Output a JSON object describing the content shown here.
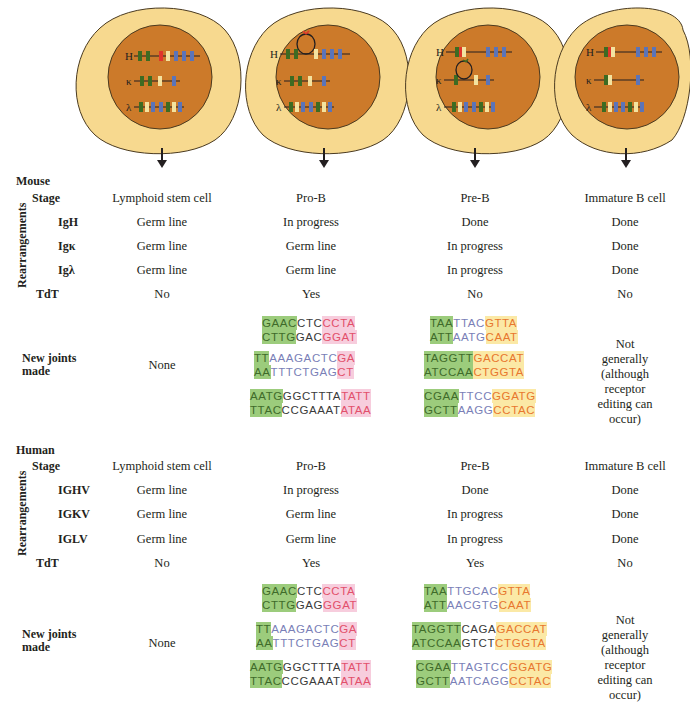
{
  "figure": {
    "cells": [
      {
        "stage": "Lymphoid stem cell",
        "loci": [
          "H",
          "κ",
          "λ"
        ],
        "loop": "none"
      },
      {
        "stage": "Pro-B",
        "loci": [
          "H",
          "κ",
          "λ"
        ],
        "loop": "H"
      },
      {
        "stage": "Pre-B",
        "loci": [
          "H",
          "κ",
          "λ"
        ],
        "loop": "κ"
      },
      {
        "stage": "Immature B cell",
        "loci": [
          "H",
          "κ",
          "λ"
        ],
        "loop": "none"
      }
    ],
    "colors": {
      "cytoplasm": "#f7d98f",
      "nucleus": "#cc7a2a",
      "segment_green": "#3d6b22",
      "segment_blue": "#5b74b8",
      "segment_yellow": "#f3e3a0",
      "segment_red": "#e0352b",
      "seq_green_bg": "#9ccc7c",
      "seq_pink_bg": "#f7cddd",
      "seq_yellow_bg": "#fbe9a6"
    }
  },
  "mouse": {
    "title": "Mouse",
    "stage_label": "Stage",
    "rearrangements_label": "Rearrangements",
    "tdt_label": "TdT",
    "joints_label_1": "New joints",
    "joints_label_2": "made",
    "genes": [
      "IgH",
      "Igκ",
      "Igλ"
    ],
    "stages": [
      "Lymphoid stem cell",
      "Pro-B",
      "Pre-B",
      "Immature B cell"
    ],
    "rows": [
      [
        "Germ line",
        "In progress",
        "Done",
        "Done"
      ],
      [
        "Germ line",
        "Germ line",
        "In progress",
        "Done"
      ],
      [
        "Germ line",
        "Germ line",
        "In progress",
        "Done"
      ]
    ],
    "tdt": [
      "No",
      "Yes",
      "No",
      "No"
    ],
    "joints_none": "None",
    "joints_immature": [
      "Not generally",
      "(although",
      "receptor",
      "editing can",
      "occur)"
    ],
    "pro_b_seqs": [
      {
        "top": [
          [
            "g",
            "GAAC"
          ],
          [
            "k",
            "CTC"
          ],
          [
            "p",
            "CCTA"
          ]
        ],
        "bot": [
          [
            "g",
            "CTTG"
          ],
          [
            "k",
            "GAC"
          ],
          [
            "p",
            "GGAT"
          ]
        ]
      },
      {
        "top": [
          [
            "g",
            "TT"
          ],
          [
            "b",
            "AAAGACTC"
          ],
          [
            "p",
            "GA"
          ]
        ],
        "bot": [
          [
            "g",
            "AA"
          ],
          [
            "b",
            "TTTCTGAG"
          ],
          [
            "p",
            "CT"
          ]
        ]
      },
      {
        "top": [
          [
            "g",
            "AATG"
          ],
          [
            "k",
            "GGCTTTA"
          ],
          [
            "p",
            "TATT"
          ]
        ],
        "bot": [
          [
            "g",
            "TTAC"
          ],
          [
            "k",
            "CCGAAAT"
          ],
          [
            "p",
            "ATAA"
          ]
        ]
      }
    ],
    "pre_b_seqs": [
      {
        "top": [
          [
            "g",
            "TAA"
          ],
          [
            "b",
            "TTAC"
          ],
          [
            "y",
            "GTTA"
          ]
        ],
        "bot": [
          [
            "g",
            "ATT"
          ],
          [
            "b",
            "AATG"
          ],
          [
            "y",
            "CAAT"
          ]
        ]
      },
      {
        "top": [
          [
            "g",
            "TAGGTT"
          ],
          [
            "y",
            "GACCAT"
          ]
        ],
        "bot": [
          [
            "g",
            "ATCCAA"
          ],
          [
            "y",
            "CTGGTA"
          ]
        ]
      },
      {
        "top": [
          [
            "g",
            "CGAA"
          ],
          [
            "b",
            "TTCC"
          ],
          [
            "y",
            "GGATG"
          ]
        ],
        "bot": [
          [
            "g",
            "GCTT"
          ],
          [
            "b",
            "AAGG"
          ],
          [
            "y",
            "CCTAC"
          ]
        ]
      }
    ]
  },
  "human": {
    "title": "Human",
    "stage_label": "Stage",
    "rearrangements_label": "Rearrangements",
    "tdt_label": "TdT",
    "joints_label_1": "New joints",
    "joints_label_2": "made",
    "genes": [
      "IGHV",
      "IGKV",
      "IGLV"
    ],
    "stages": [
      "Lymphoid stem cell",
      "Pro-B",
      "Pre-B",
      "Immature B cell"
    ],
    "rows": [
      [
        "Germ line",
        "In progress",
        "Done",
        "Done"
      ],
      [
        "Germ line",
        "Germ line",
        "In progress",
        "Done"
      ],
      [
        "Germ line",
        "Germ line",
        "In progress",
        "Done"
      ]
    ],
    "tdt": [
      "No",
      "Yes",
      "Yes",
      "No"
    ],
    "joints_none": "None",
    "joints_immature": [
      "Not generally",
      "(although",
      "receptor",
      "editing can",
      "occur)"
    ],
    "pro_b_seqs": [
      {
        "top": [
          [
            "g",
            "GAAC"
          ],
          [
            "k",
            "CTC"
          ],
          [
            "p",
            "CCTA"
          ]
        ],
        "bot": [
          [
            "g",
            "CTTG"
          ],
          [
            "k",
            "GAG"
          ],
          [
            "p",
            "GGAT"
          ]
        ]
      },
      {
        "top": [
          [
            "g",
            "TT"
          ],
          [
            "b",
            "AAAGACTC"
          ],
          [
            "p",
            "GA"
          ]
        ],
        "bot": [
          [
            "g",
            "AA"
          ],
          [
            "b",
            "TTTCTGAG"
          ],
          [
            "p",
            "CT"
          ]
        ]
      },
      {
        "top": [
          [
            "g",
            "AATG"
          ],
          [
            "k",
            "GGCTTTA"
          ],
          [
            "p",
            "TATT"
          ]
        ],
        "bot": [
          [
            "g",
            "TTAC"
          ],
          [
            "k",
            "CCGAAAT"
          ],
          [
            "p",
            "ATAA"
          ]
        ]
      }
    ],
    "pre_b_seqs": [
      {
        "top": [
          [
            "g",
            "TAA"
          ],
          [
            "b",
            "TTGCAC"
          ],
          [
            "y",
            "GTTA"
          ]
        ],
        "bot": [
          [
            "g",
            "ATT"
          ],
          [
            "b",
            "AACGTG"
          ],
          [
            "y",
            "CAAT"
          ]
        ]
      },
      {
        "top": [
          [
            "g",
            "TAGGTT"
          ],
          [
            "k",
            "CAGA"
          ],
          [
            "y",
            "GACCAT"
          ]
        ],
        "bot": [
          [
            "g",
            "ATCCAA"
          ],
          [
            "k",
            "GTCT"
          ],
          [
            "y",
            "CTGGTA"
          ]
        ]
      },
      {
        "top": [
          [
            "g",
            "CGAA"
          ],
          [
            "b",
            "TTAGTCC"
          ],
          [
            "y",
            "GGATG"
          ]
        ],
        "bot": [
          [
            "g",
            "GCTT"
          ],
          [
            "b",
            "AATCAGG"
          ],
          [
            "y",
            "CCTAC"
          ]
        ]
      }
    ]
  }
}
